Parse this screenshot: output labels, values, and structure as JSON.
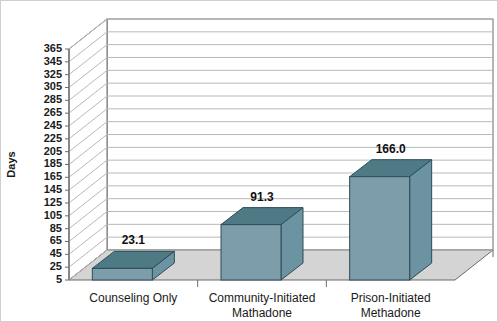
{
  "chart_data": {
    "type": "bar",
    "title": "",
    "subtitle": "",
    "xlabel": "",
    "ylabel": "Days",
    "categories": [
      "Counseling Only",
      "Community-Initiated Mathadone",
      "Prison-Initiated Methadone"
    ],
    "category_lines": [
      [
        "Counseling Only"
      ],
      [
        "Community-Initiated",
        "Mathadone"
      ],
      [
        "Prison-Initiated",
        "Methadone"
      ]
    ],
    "values": [
      23.1,
      91.3,
      166.0
    ],
    "value_labels": [
      "23.1",
      "91.3",
      "166.0"
    ],
    "ylim": [
      5,
      365
    ],
    "ytick_step": 20,
    "yticks": [
      5,
      25,
      45,
      65,
      85,
      105,
      125,
      145,
      165,
      185,
      205,
      225,
      245,
      265,
      285,
      305,
      325,
      345,
      365
    ],
    "ytick_labels": [
      "5",
      "25",
      "45",
      "65",
      "85",
      "105",
      "125",
      "145",
      "165",
      "185",
      "205",
      "225",
      "245",
      "265",
      "285",
      "305",
      "325",
      "345",
      "365"
    ],
    "grid": true,
    "grid_axis": "y",
    "legend": false,
    "legend_position": "none",
    "three_d": true,
    "colors": {
      "bar_front": "#7d9dab",
      "bar_side": "#6c93a1",
      "bar_top": "#4e7a85",
      "bar_outline": "#2d4d57",
      "floor": "#d4d4d4",
      "wall": "#ffffff",
      "gridline": "#b9b9b9",
      "axis": "#6b6b6b",
      "text": "#1a1a1a",
      "border": "#cfcfcf"
    }
  }
}
